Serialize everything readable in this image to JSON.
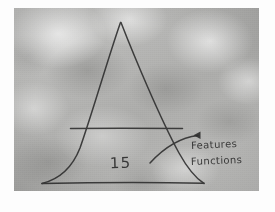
{
  "photo": {
    "media": "photograph of a hand-drawn diagram",
    "surface_color": "#b5b5b3",
    "border_color": "#fdfdfd",
    "ink_color": "#2e2e2e"
  },
  "diagram": {
    "type": "pyramid",
    "shape_name": "triangle",
    "apex": {
      "x": 120,
      "y": 22
    },
    "base_left": {
      "x": 42,
      "y": 183
    },
    "base_right": {
      "x": 203,
      "y": 183
    },
    "divider": {
      "name": "horizontal-divider-line",
      "y": 128,
      "x_start": 70,
      "x_end": 182
    },
    "labels": {
      "quantity": "15",
      "features": "Features",
      "functions": "Functions"
    },
    "annotation_arrow": {
      "name": "curved-arrow",
      "start": {
        "x": 150,
        "y": 162
      },
      "end": {
        "x": 199,
        "y": 136
      },
      "direction": "up-right",
      "points_to": "upper-right region of pyramid base band"
    }
  }
}
